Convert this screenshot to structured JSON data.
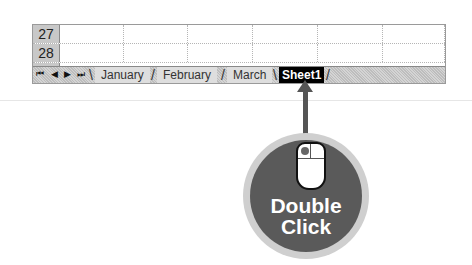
{
  "spreadsheet": {
    "rows": [
      {
        "num": "27"
      },
      {
        "num": "28"
      },
      {
        "num": "29"
      }
    ],
    "column_count": 6
  },
  "tab_bar": {
    "nav_buttons": [
      {
        "name": "first-sheet",
        "glyph": "⏮"
      },
      {
        "name": "prev-sheet",
        "glyph": "◀"
      },
      {
        "name": "next-sheet",
        "glyph": "▶"
      },
      {
        "name": "last-sheet",
        "glyph": "⏭"
      }
    ],
    "tabs": [
      {
        "label": "January",
        "active": false
      },
      {
        "label": "February",
        "active": false
      },
      {
        "label": "March",
        "active": false
      },
      {
        "label": "Sheet1",
        "active": true
      }
    ]
  },
  "callout": {
    "line1": "Double",
    "line2": "Click",
    "icon": "mouse-icon"
  }
}
